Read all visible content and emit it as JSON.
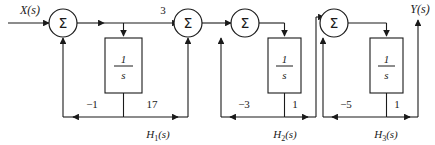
{
  "diagram": {
    "title_visible": false,
    "input_label": "X(s)",
    "output_label": "Y(s)",
    "sum_symbol": "Σ",
    "integrator_numerator": "1",
    "integrator_denominator": "s",
    "forward_gain_label": "3",
    "stroke_color": "#1a1a1a",
    "background_color": "#ffffff",
    "summing_junctions": [
      {
        "id": "sum1",
        "label": "Σ",
        "cx": 63,
        "cy": 23,
        "r": 14
      },
      {
        "id": "sum2",
        "label": "Σ",
        "cx": 188,
        "cy": 23,
        "r": 14
      },
      {
        "id": "sum3",
        "label": "Σ",
        "cx": 245,
        "cy": 23,
        "r": 14
      },
      {
        "id": "sum4",
        "label": "Σ",
        "cx": 334,
        "cy": 23,
        "r": 14
      }
    ],
    "integrator_blocks": [
      {
        "id": "int1",
        "x": 105,
        "y": 38,
        "w": 37,
        "h": 55,
        "num": "1",
        "den": "s"
      },
      {
        "id": "int2",
        "x": 268,
        "y": 38,
        "w": 33,
        "h": 55,
        "num": "1",
        "den": "s"
      },
      {
        "id": "int3",
        "x": 370,
        "y": 38,
        "w": 33,
        "h": 55,
        "num": "1",
        "den": "s"
      }
    ],
    "feedback_sections": [
      {
        "id": "H1",
        "name": "H1(s)",
        "name_base": "H",
        "name_sub": "1",
        "name_suffix": "(s)",
        "negative_gain": "−1",
        "positive_gain": "17",
        "label_x": 158,
        "label_y": 137
      },
      {
        "id": "H2",
        "name": "H2(s)",
        "name_base": "H",
        "name_sub": "2",
        "name_suffix": "(s)",
        "negative_gain": "−3",
        "positive_gain": "1",
        "label_x": 285,
        "label_y": 137
      },
      {
        "id": "H3",
        "name": "H3(s)",
        "name_base": "H",
        "name_sub": "3",
        "name_suffix": "(s)",
        "negative_gain": "−5",
        "positive_gain": "1",
        "label_x": 386,
        "label_y": 137
      }
    ],
    "gain_labels": [
      {
        "id": "g-fwd-3",
        "text": "3",
        "x": 163,
        "y": 14
      },
      {
        "id": "g-h1-neg",
        "text": "−1",
        "x": 92,
        "y": 108
      },
      {
        "id": "g-h1-pos",
        "text": "17",
        "x": 152,
        "y": 108
      },
      {
        "id": "g-h2-neg",
        "text": "−3",
        "x": 244,
        "y": 108
      },
      {
        "id": "g-h2-pos",
        "text": "1",
        "x": 295,
        "y": 108
      },
      {
        "id": "g-h3-neg",
        "text": "−5",
        "x": 346,
        "y": 108
      },
      {
        "id": "g-h3-pos",
        "text": "1",
        "x": 397,
        "y": 108
      }
    ]
  }
}
